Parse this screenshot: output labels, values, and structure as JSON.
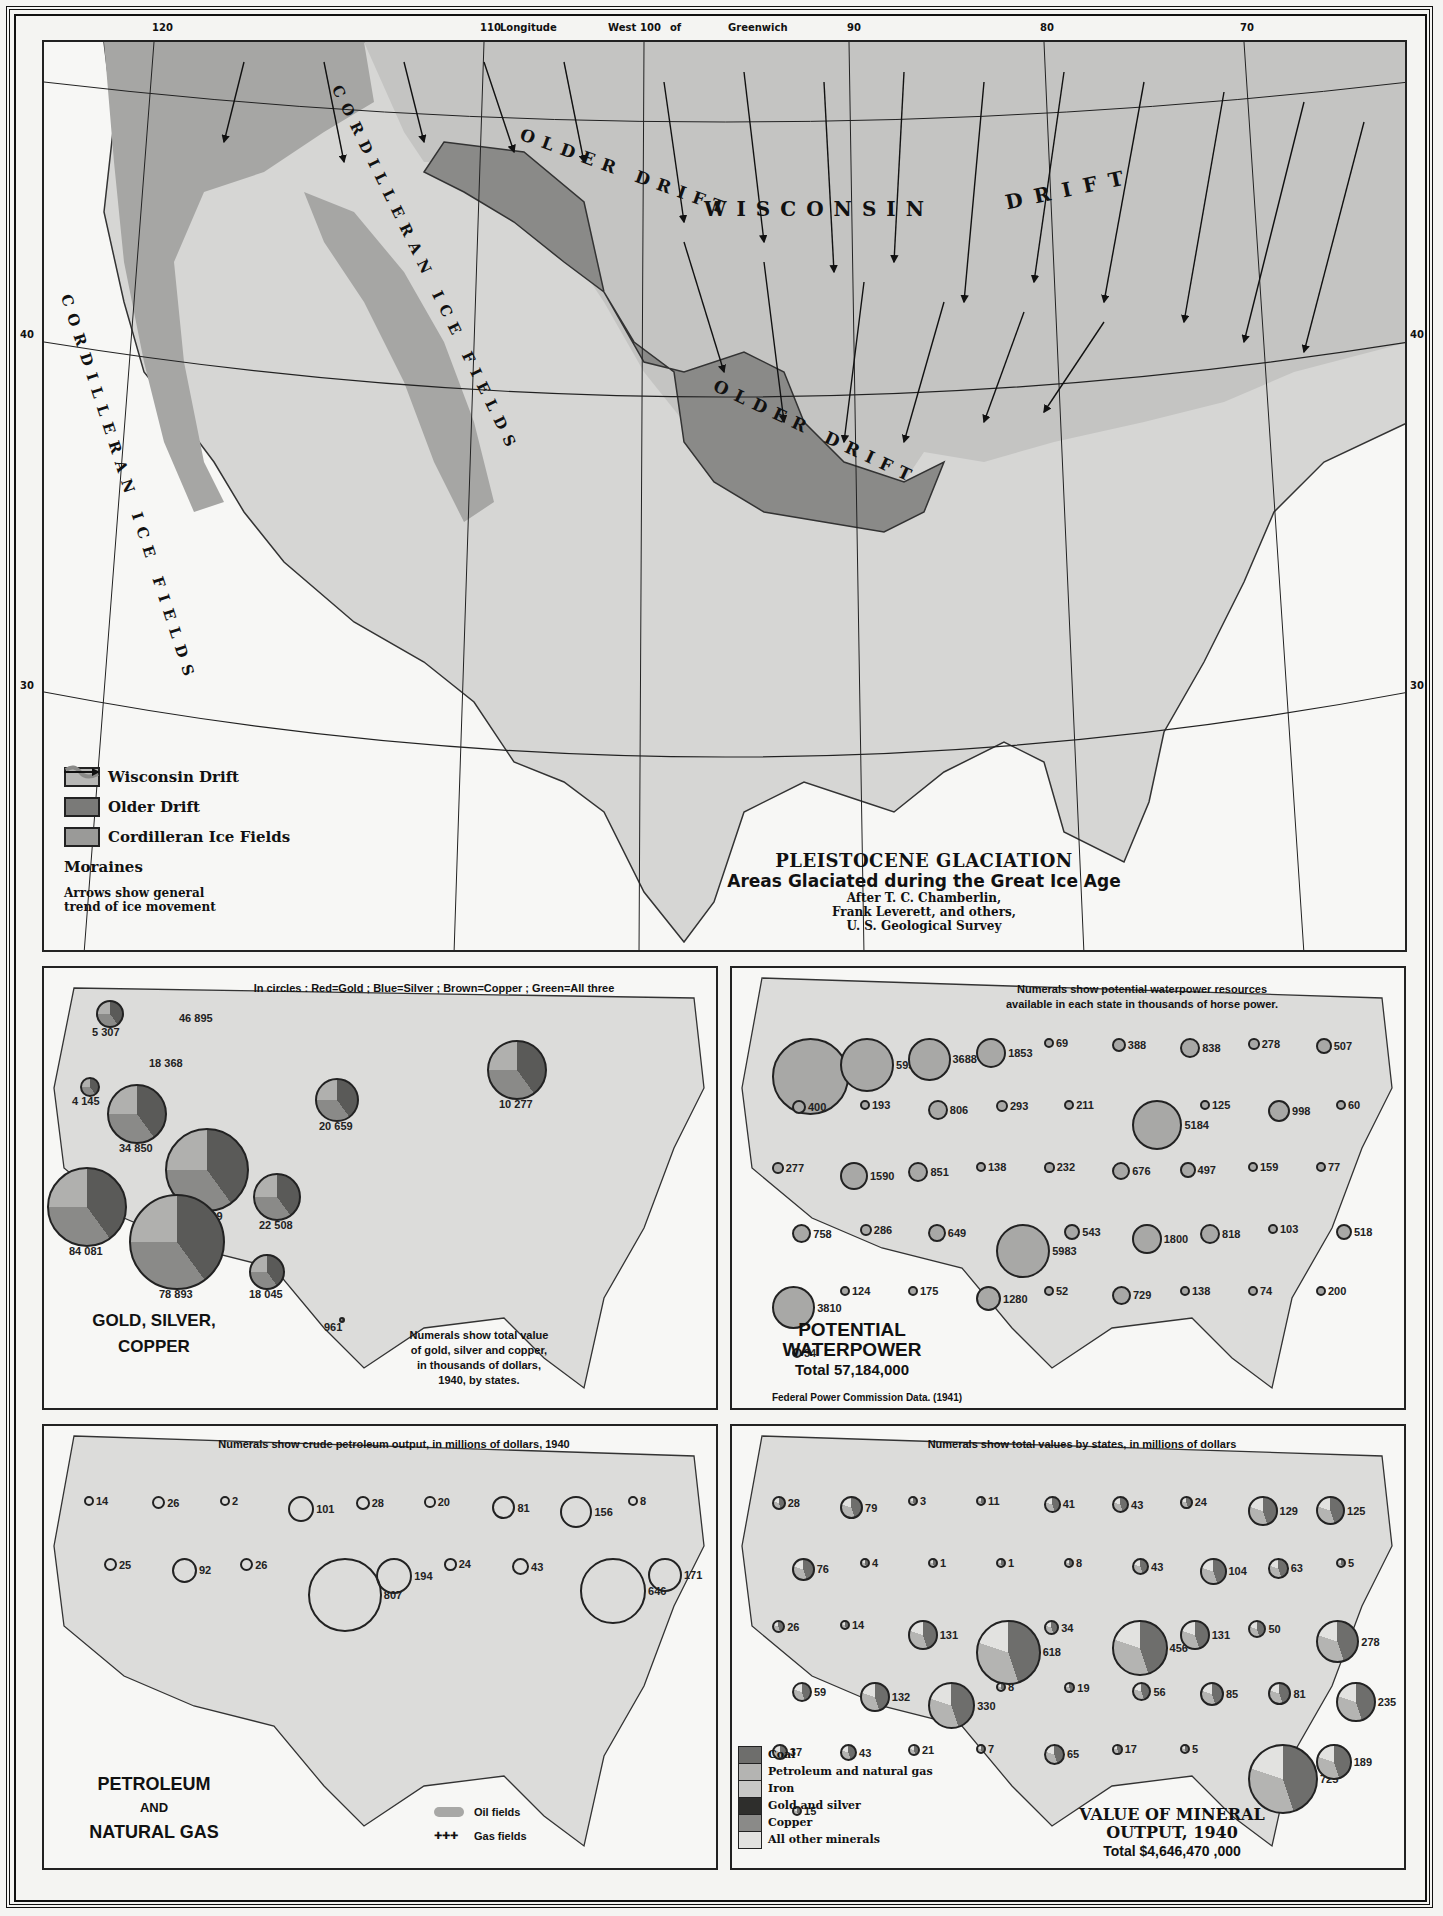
{
  "frame": {
    "longitude_ticks": [
      {
        "label": "120",
        "x": 152
      },
      {
        "label": "110",
        "x": 480
      },
      {
        "label": "Longitude",
        "x": 500
      },
      {
        "label": "West",
        "x": 608
      },
      {
        "label": "100",
        "x": 640
      },
      {
        "label": "of",
        "x": 670
      },
      {
        "label": "Greenwich",
        "x": 728
      },
      {
        "label": "90",
        "x": 847
      },
      {
        "label": "80",
        "x": 1040
      },
      {
        "label": "70",
        "x": 1240
      }
    ],
    "latitude_ticks": [
      {
        "label": "40",
        "y": 335
      },
      {
        "label": "30",
        "y": 686
      }
    ]
  },
  "glaciation": {
    "title": "PLEISTOCENE GLACIATION",
    "subtitle": "Areas Glaciated during the Great Ice Age",
    "credit_lines": [
      "After T. C. Chamberlin,",
      "Frank Leverett, and others,",
      "U. S. Geological Survey"
    ],
    "map_labels": {
      "wisconsin": "WISCONSIN",
      "drift": "DRIFT",
      "older_drift_1": "OLDER DRIFT",
      "older_drift_2": "OLDER DRIFT",
      "cordilleran_1": "CORDILLERAN ICE FIELDS",
      "cordilleran_2": "CORDILLERAN ICE FIELDS"
    },
    "legend": [
      {
        "label": "Wisconsin Drift",
        "color": "#b8b8b6"
      },
      {
        "label": "Older Drift",
        "color": "#7a7a78"
      },
      {
        "label": "Cordilleran Ice Fields",
        "color": "#9a9a98"
      },
      {
        "label": "Moraines",
        "color": "#8a8a88"
      },
      {
        "label": "Arrows show general trend of ice movement"
      }
    ]
  },
  "gold_silver_copper": {
    "note_top": "In circles : Red=Gold ; Blue=Silver ; Brown=Copper ; Green=All three",
    "title_line1": "GOLD, SILVER,",
    "title_line2": "COPPER",
    "note_bottom": [
      "Numerals show total value",
      "of gold, silver and copper,",
      "in thousands of dollars,",
      "1940, by states."
    ],
    "values": [
      {
        "label": "5 307",
        "x": 108,
        "y": 1012,
        "r": 14
      },
      {
        "label": "46 895",
        "x": 195,
        "y": 1010,
        "r": 0
      },
      {
        "label": "18 368",
        "x": 165,
        "y": 1055,
        "r": 0
      },
      {
        "label": "4 145",
        "x": 88,
        "y": 1085,
        "r": 10
      },
      {
        "label": "34 850",
        "x": 135,
        "y": 1112,
        "r": 30
      },
      {
        "label": "73 499",
        "x": 205,
        "y": 1168,
        "r": 42
      },
      {
        "label": "22 508",
        "x": 275,
        "y": 1195,
        "r": 24
      },
      {
        "label": "84 081",
        "x": 85,
        "y": 1205,
        "r": 40
      },
      {
        "label": "78 893",
        "x": 175,
        "y": 1240,
        "r": 48
      },
      {
        "label": "18 045",
        "x": 265,
        "y": 1270,
        "r": 18
      },
      {
        "label": "961",
        "x": 340,
        "y": 1318,
        "r": 3
      },
      {
        "label": "20 659",
        "x": 335,
        "y": 1098,
        "r": 22
      },
      {
        "label": "10 277",
        "x": 515,
        "y": 1068,
        "r": 30
      }
    ]
  },
  "waterpower": {
    "note_top": [
      "Numerals show potential waterpower resources",
      "available in each state in thousands of horse power."
    ],
    "title_line1": "POTENTIAL",
    "title_line2": "WATERPOWER",
    "total": "Total 57,184,000",
    "source": "Federal Power Commission Data. (1941)",
    "values": [
      "12021",
      "5956",
      "3688",
      "1853",
      "69",
      "388",
      "838",
      "278",
      "507",
      "400",
      "193",
      "806",
      "293",
      "211",
      "5184",
      "125",
      "998",
      "60",
      "277",
      "1590",
      "851",
      "138",
      "232",
      "676",
      "497",
      "159",
      "77",
      "758",
      "286",
      "649",
      "5983",
      "543",
      "1800",
      "818",
      "103",
      "518",
      "3810",
      "124",
      "175",
      "1280",
      "52",
      "729",
      "138",
      "74",
      "200",
      "34"
    ]
  },
  "petroleum": {
    "note_top": "Numerals show crude petroleum output, in millions of dollars, 1940",
    "title_line1": "PETROLEUM",
    "title_line2": "AND",
    "title_line3": "NATURAL GAS",
    "legend_oil": "Oil fields",
    "legend_gas": "Gas fields",
    "values": [
      "14",
      "26",
      "2",
      "101",
      "28",
      "20",
      "81",
      "156",
      "8",
      "25",
      "92",
      "26",
      "807",
      "194",
      "24",
      "43",
      "646",
      "171"
    ]
  },
  "mineral": {
    "note_top": "Numerals show total values by states, in millions of dollars",
    "title_line1": "VALUE OF MINERAL",
    "title_line2": "OUTPUT, 1940",
    "total": "Total $4,646,470 ,000",
    "legend": [
      {
        "label": "Coal",
        "color": "#6e6e6c"
      },
      {
        "label": "Petroleum and natural gas",
        "color": "#b4b4b2"
      },
      {
        "label": "Iron",
        "color": "#c8c8c6"
      },
      {
        "label": "Gold and silver",
        "color": "#2e2e2c"
      },
      {
        "label": "Copper",
        "color": "#8a8a88"
      },
      {
        "label": "All other minerals",
        "color": "#e2e2e0"
      }
    ],
    "values": [
      "28",
      "79",
      "3",
      "11",
      "41",
      "43",
      "24",
      "129",
      "125",
      "76",
      "4",
      "1",
      "1",
      "8",
      "43",
      "104",
      "63",
      "5",
      "26",
      "14",
      "131",
      "618",
      "34",
      "456",
      "131",
      "50",
      "278",
      "59",
      "132",
      "330",
      "8",
      "19",
      "56",
      "85",
      "81",
      "235",
      "37",
      "43",
      "21",
      "7",
      "65",
      "17",
      "5",
      "725",
      "189",
      "15"
    ]
  },
  "chart_data": [
    {
      "type": "table",
      "title": "GOLD, SILVER, COPPER",
      "subtitle": "Numerals show total value of gold, silver and copper, in thousands of dollars, 1940, by states.",
      "categories": [
        "Washington",
        "Montana",
        "Idaho",
        "Oregon",
        "Nevada",
        "Utah",
        "Colorado",
        "California",
        "Arizona",
        "New Mexico",
        "Texas",
        "South Dakota",
        "Michigan"
      ],
      "values": [
        5307,
        46895,
        18368,
        4145,
        34850,
        73499,
        22508,
        84081,
        78893,
        18045,
        961,
        20659,
        10277
      ]
    },
    {
      "type": "table",
      "title": "POTENTIAL WATERPOWER",
      "subtitle": "Thousands of horse power; Total 57,184,000",
      "categories": [
        "Washington",
        "Oregon",
        "Idaho",
        "Montana",
        "North Dakota",
        "Minnesota",
        "Wyoming",
        "South Dakota",
        "Wisconsin",
        "Michigan",
        "New York",
        "Maine",
        "Pennsylvania",
        "California",
        "Arizona",
        "Tennessee",
        "Alabama"
      ],
      "values": [
        12021,
        5956,
        3688,
        1853,
        69,
        388,
        838,
        278,
        507,
        400,
        5184,
        806,
        998,
        5983,
        3810,
        1800,
        1280
      ]
    },
    {
      "type": "table",
      "title": "PETROLEUM AND NATURAL GAS",
      "subtitle": "Crude petroleum output, millions of dollars, 1940",
      "categories": [
        "California",
        "Texas",
        "Oklahoma",
        "Kansas",
        "Louisiana",
        "Illinois",
        "Wyoming",
        "New Mexico",
        "Pennsylvania",
        "Michigan"
      ],
      "values": [
        807,
        646,
        194,
        101,
        171,
        156,
        26,
        43,
        81,
        28
      ]
    },
    {
      "type": "table",
      "title": "VALUE OF MINERAL OUTPUT, 1940",
      "subtitle": "Millions of dollars; Total $4,646,470,000",
      "categories": [
        "Texas",
        "Pennsylvania",
        "California",
        "West Virginia",
        "Illinois",
        "Oklahoma",
        "Louisiana",
        "Ohio",
        "Kentucky",
        "Minnesota",
        "Michigan",
        "Kansas"
      ],
      "values": [
        725,
        618,
        456,
        330,
        278,
        235,
        189,
        131,
        132,
        129,
        125,
        131
      ]
    }
  ]
}
